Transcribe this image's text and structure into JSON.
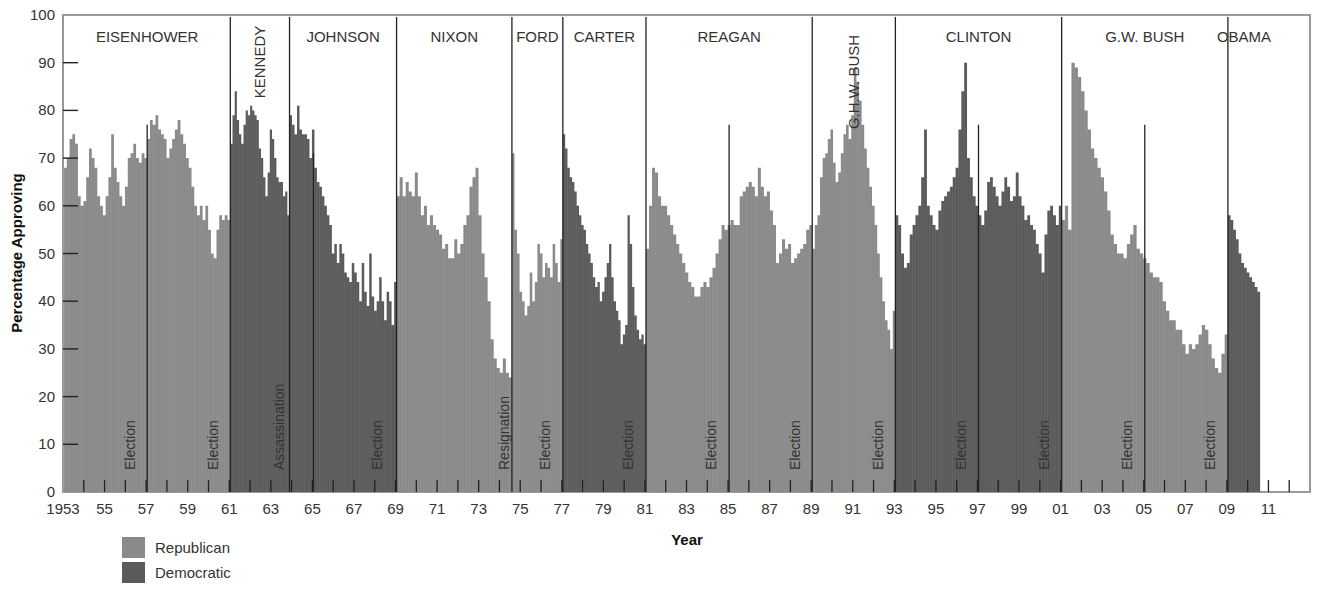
{
  "chart_data": {
    "type": "bar",
    "title": "",
    "xlabel": "Year",
    "ylabel": "Percentage Approving",
    "ylim": [
      0,
      100
    ],
    "xlim": [
      1953,
      2013
    ],
    "yticks": [
      0,
      10,
      20,
      30,
      40,
      50,
      60,
      70,
      80,
      90,
      100
    ],
    "xtick_labels": [
      {
        "year": 1953,
        "label": "1953"
      },
      {
        "year": 1955,
        "label": "55"
      },
      {
        "year": 1957,
        "label": "57"
      },
      {
        "year": 1959,
        "label": "59"
      },
      {
        "year": 1961,
        "label": "61"
      },
      {
        "year": 1963,
        "label": "63"
      },
      {
        "year": 1965,
        "label": "65"
      },
      {
        "year": 1967,
        "label": "67"
      },
      {
        "year": 1969,
        "label": "69"
      },
      {
        "year": 1971,
        "label": "71"
      },
      {
        "year": 1973,
        "label": "73"
      },
      {
        "year": 1975,
        "label": "75"
      },
      {
        "year": 1977,
        "label": "77"
      },
      {
        "year": 1979,
        "label": "79"
      },
      {
        "year": 1981,
        "label": "81"
      },
      {
        "year": 1983,
        "label": "83"
      },
      {
        "year": 1985,
        "label": "85"
      },
      {
        "year": 1987,
        "label": "87"
      },
      {
        "year": 1989,
        "label": "89"
      },
      {
        "year": 1991,
        "label": "91"
      },
      {
        "year": 1993,
        "label": "93"
      },
      {
        "year": 1995,
        "label": "95"
      },
      {
        "year": 1997,
        "label": "97"
      },
      {
        "year": 1999,
        "label": "99"
      },
      {
        "year": 2001,
        "label": "01"
      },
      {
        "year": 2003,
        "label": "03"
      },
      {
        "year": 2005,
        "label": "05"
      },
      {
        "year": 2007,
        "label": "07"
      },
      {
        "year": 2009,
        "label": "09"
      },
      {
        "year": 2011,
        "label": "11"
      }
    ],
    "legend": [
      {
        "name": "Republican",
        "color": "#8a8a8a"
      },
      {
        "name": "Democratic",
        "color": "#5a5a5a"
      }
    ],
    "presidents": [
      {
        "name": "EISENHOWER",
        "party": "Republican",
        "start": 1953.05,
        "end": 1961.05,
        "vertical": false,
        "values": [
          68,
          70,
          74,
          75,
          73,
          62,
          60,
          61,
          66,
          72,
          70,
          68,
          62,
          60,
          58,
          62,
          66,
          75,
          68,
          65,
          62,
          60,
          64,
          70,
          71,
          73,
          70,
          69,
          71,
          70,
          74,
          78,
          77,
          79,
          76,
          75,
          74,
          70,
          72,
          74,
          76,
          78,
          75,
          73,
          70,
          68,
          64,
          60,
          58,
          60,
          57,
          60,
          55,
          50,
          49,
          55,
          58,
          57,
          58,
          57
        ]
      },
      {
        "name": "KENNEDY",
        "party": "Democratic",
        "start": 1961.05,
        "end": 1963.9,
        "vertical": true,
        "values": [
          73,
          79,
          84,
          78,
          75,
          73,
          77,
          80,
          79,
          81,
          80,
          79,
          78,
          72,
          70,
          66,
          62,
          67,
          76,
          74,
          70,
          66,
          65,
          65,
          62,
          63,
          58
        ]
      },
      {
        "name": "JOHNSON",
        "party": "Democratic",
        "start": 1963.9,
        "end": 1969.05,
        "vertical": false,
        "values": [
          79,
          77,
          75,
          81,
          76,
          75,
          75,
          74,
          70,
          76,
          68,
          65,
          64,
          62,
          60,
          58,
          56,
          50,
          52,
          48,
          52,
          50,
          46,
          45,
          44,
          48,
          46,
          44,
          40,
          48,
          42,
          39,
          50,
          41,
          38,
          40,
          45,
          40,
          36,
          42,
          40,
          35,
          44
        ]
      },
      {
        "name": "NIXON",
        "party": "Republican",
        "start": 1969.05,
        "end": 1974.6,
        "vertical": false,
        "values": [
          62,
          66,
          62,
          65,
          63,
          62,
          67,
          62,
          58,
          60,
          56,
          58,
          56,
          55,
          54,
          51,
          52,
          49,
          49,
          53,
          50,
          52,
          56,
          58,
          64,
          66,
          68,
          58,
          50,
          45,
          40,
          32,
          28,
          26,
          25,
          28,
          25,
          24
        ]
      },
      {
        "name": "FORD",
        "party": "Republican",
        "start": 1974.6,
        "end": 1977.05,
        "vertical": false,
        "values": [
          71,
          55,
          50,
          42,
          40,
          37,
          39,
          46,
          40,
          44,
          52,
          50,
          45,
          48,
          47,
          45,
          52,
          48,
          44,
          53
        ]
      },
      {
        "name": "CARTER",
        "party": "Democratic",
        "start": 1977.05,
        "end": 1981.05,
        "vertical": false,
        "values": [
          75,
          72,
          68,
          66,
          65,
          63,
          60,
          58,
          56,
          55,
          52,
          50,
          48,
          45,
          43,
          44,
          40,
          42,
          45,
          48,
          52,
          45,
          40,
          38,
          36,
          31,
          33,
          35,
          58,
          52,
          43,
          37,
          34,
          32,
          33,
          31
        ]
      },
      {
        "name": "REAGAN",
        "party": "Republican",
        "start": 1981.05,
        "end": 1989.05,
        "vertical": false,
        "values": [
          51,
          60,
          68,
          67,
          62,
          60,
          60,
          58,
          56,
          54,
          52,
          50,
          48,
          46,
          44,
          43,
          41,
          41,
          43,
          44,
          43,
          45,
          47,
          50,
          53,
          56,
          55,
          56,
          57,
          56,
          56,
          62,
          63,
          64,
          65,
          64,
          62,
          68,
          64,
          62,
          63,
          59,
          56,
          48,
          50,
          53,
          51,
          52,
          48,
          49,
          50,
          51,
          52,
          55,
          56
        ]
      },
      {
        "name": "G.H.W. BUSH",
        "party": "Republican",
        "start": 1989.05,
        "end": 1993.05,
        "vertical": true,
        "values": [
          51,
          56,
          58,
          66,
          70,
          71,
          74,
          76,
          69,
          65,
          67,
          71,
          75,
          77,
          74,
          79,
          89,
          86,
          82,
          77,
          72,
          68,
          64,
          60,
          56,
          50,
          45,
          40,
          36,
          34,
          30,
          38
        ]
      },
      {
        "name": "CLINTON",
        "party": "Democratic",
        "start": 1993.05,
        "end": 2001.05,
        "vertical": false,
        "values": [
          58,
          56,
          50,
          47,
          48,
          54,
          56,
          58,
          60,
          66,
          76,
          60,
          58,
          56,
          55,
          59,
          61,
          62,
          63,
          64,
          66,
          68,
          76,
          84,
          90,
          70,
          66,
          62,
          60,
          58,
          56,
          59,
          65,
          66,
          64,
          62,
          60,
          63,
          66,
          64,
          61,
          62,
          67,
          62,
          60,
          57,
          58,
          56,
          55,
          52,
          50,
          46,
          54,
          59,
          60,
          58,
          56,
          60
        ]
      },
      {
        "name": "G.W. BUSH",
        "party": "Republican",
        "start": 2001.05,
        "end": 2009.05,
        "vertical": false,
        "values": [
          57,
          60,
          55,
          90,
          89,
          87,
          84,
          80,
          76,
          72,
          70,
          68,
          66,
          63,
          59,
          54,
          52,
          50,
          50,
          49,
          52,
          54,
          56,
          51,
          50,
          49,
          48,
          46,
          45,
          45,
          44,
          40,
          38,
          36,
          36,
          34,
          34,
          31,
          29,
          31,
          30,
          31,
          33,
          35,
          34,
          31,
          28,
          26,
          25,
          29,
          33
        ]
      },
      {
        "name": "OBAMA",
        "party": "Democratic",
        "start": 2009.05,
        "end": 2010.6,
        "vertical": false,
        "values": [
          58,
          57,
          55,
          53,
          50,
          48,
          47,
          46,
          45,
          44,
          43,
          42
        ]
      }
    ],
    "events": [
      {
        "label": "Election",
        "year": 1956.2
      },
      {
        "label": "Election",
        "year": 1960.2
      },
      {
        "label": "Assassination",
        "year": 1963.4
      },
      {
        "label": "Election",
        "year": 1968.1
      },
      {
        "label": "Resignation",
        "year": 1974.2
      },
      {
        "label": "Election",
        "year": 1976.2
      },
      {
        "label": "Election",
        "year": 1980.2
      },
      {
        "label": "Election",
        "year": 1984.2
      },
      {
        "label": "Election",
        "year": 1988.2
      },
      {
        "label": "Election",
        "year": 1992.2
      },
      {
        "label": "Election",
        "year": 1996.2
      },
      {
        "label": "Election",
        "year": 2000.2
      },
      {
        "label": "Election",
        "year": 2004.2
      },
      {
        "label": "Election",
        "year": 2008.2
      }
    ],
    "term_dividers": [
      1957.05,
      1965.05,
      1985.05,
      1997.05,
      2005.05
    ],
    "grid": false
  },
  "legend": {
    "items": [
      {
        "label": "Republican",
        "color": "#8a8a8a"
      },
      {
        "label": "Democratic",
        "color": "#5a5a5a"
      }
    ]
  },
  "axes": {
    "y_title": "Percentage Approving",
    "x_title": "Year"
  }
}
